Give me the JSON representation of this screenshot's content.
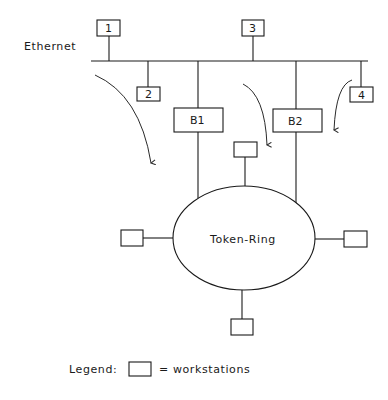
{
  "diagram": {
    "ethernet_label": "Ethernet",
    "ring_label": "Token-Ring",
    "nodes": [
      {
        "id": "1",
        "label": "1"
      },
      {
        "id": "2",
        "label": "2"
      },
      {
        "id": "3",
        "label": "3"
      },
      {
        "id": "4",
        "label": "4"
      }
    ],
    "bridges": [
      {
        "id": "B1",
        "label": "B1"
      },
      {
        "id": "B2",
        "label": "B2"
      }
    ],
    "ring_workstations": [
      "top",
      "left",
      "right",
      "bottom"
    ],
    "arrows": 3
  },
  "legend": {
    "title": "Legend:",
    "symbol": "workstation-box",
    "text": "= workstations"
  },
  "colors": {
    "line": "#1a1a1a",
    "background": "#ffffff"
  }
}
